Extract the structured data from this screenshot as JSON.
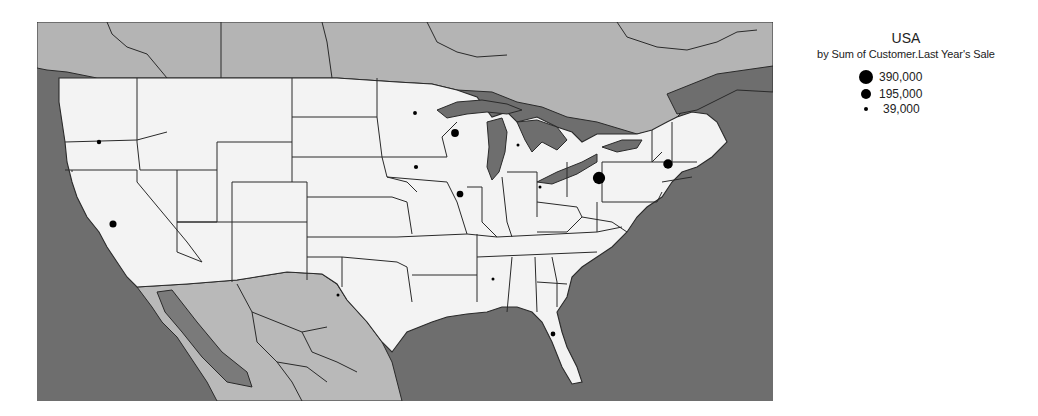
{
  "legend": {
    "title": "USA",
    "subtitle": "by Sum of Customer.Last Year's Sale",
    "items": [
      {
        "value": 390000,
        "label": "390,000"
      },
      {
        "value": 195000,
        "label": "195,000"
      },
      {
        "value": 39000,
        "label": "39,000"
      }
    ]
  },
  "colors": {
    "ocean": "#6e6e6e",
    "canada": "#b4b4b4",
    "mexico": "#b9b9b9",
    "usa": "#f3f3f3",
    "dot": "#000000"
  },
  "chart_data": {
    "type": "proportional-symbol-map",
    "title": "USA",
    "subtitle": "by Sum of Customer.Last Year's Sale",
    "legend_values": [
      390000,
      195000,
      39000
    ],
    "points": [
      {
        "state": "Oregon",
        "value": 39000
      },
      {
        "state": "California",
        "value": 100000
      },
      {
        "state": "Minnesota",
        "value": 30000
      },
      {
        "state": "Wisconsin",
        "value": 120000
      },
      {
        "state": "Iowa",
        "value": 35000
      },
      {
        "state": "Illinois",
        "value": 90000
      },
      {
        "state": "Michigan",
        "value": 15000
      },
      {
        "state": "Ohio",
        "value": 15000
      },
      {
        "state": "Pennsylvania",
        "value": 300000
      },
      {
        "state": "Massachusetts",
        "value": 180000
      },
      {
        "state": "Texas",
        "value": 10000
      },
      {
        "state": "Alabama",
        "value": 10000
      },
      {
        "state": "Florida",
        "value": 45000
      }
    ]
  }
}
